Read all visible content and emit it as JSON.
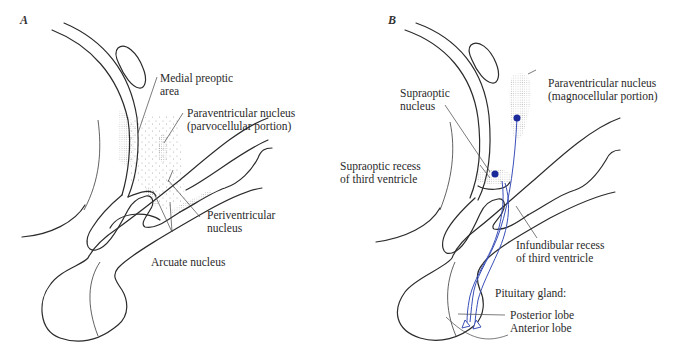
{
  "figure": {
    "panels": [
      {
        "id": "A",
        "letter": "A",
        "labels": {
          "medial_preoptic_area": "Medial preoptic\narea",
          "paraventricular_parvo": "Paraventricular nucleus\n(parvocellular portion)",
          "periventricular": "Periventricular\nnucleus",
          "arcuate": "Arcuate nucleus"
        }
      },
      {
        "id": "B",
        "letter": "B",
        "labels": {
          "supraoptic_nucleus": "Supraoptic\nnucleus",
          "paraventricular_magno": "Paraventricular nucleus\n(magnocellular portion)",
          "supraoptic_recess": "Supraoptic recess\nof third ventricle",
          "infundibular_recess": "Infundibular recess\nof third ventricle",
          "pituitary_gland": "Pituitary gland:",
          "posterior_lobe": "Posterior lobe",
          "anterior_lobe": "Anterior lobe"
        }
      }
    ],
    "colors": {
      "outline": "#2b2b2b",
      "stipple": "#9a9a9a",
      "neuron": "#1a2a9a",
      "axon": "#3a4fb8"
    }
  }
}
